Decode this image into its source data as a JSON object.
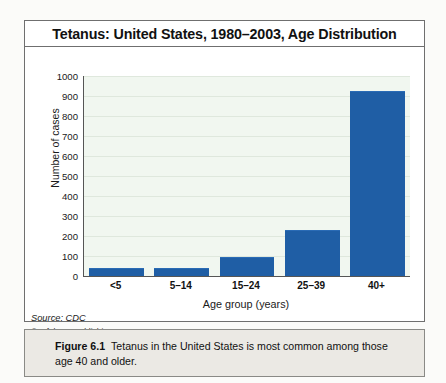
{
  "chart": {
    "title": "Tetanus: United States, 1980–2003, Age Distribution",
    "source": "Source: CDC",
    "copyright": "© Infobase Publishing"
  },
  "caption": {
    "label": "Figure 6.1",
    "text": "Tetanus in the United States is most common among those age 40 and older."
  },
  "colors": {
    "bar": "#1f5ea5",
    "plot_background": "#f1f7f0",
    "gridline": "#dfe8dd",
    "axis": "#555555",
    "caption_background": "#ebe9e4"
  },
  "chart_data": {
    "type": "bar",
    "title": "Tetanus: United States, 1980–2003, Age Distribution",
    "xlabel": "Age group (years)",
    "ylabel": "Number of cases",
    "categories": [
      "<5",
      "5–14",
      "15–24",
      "25–39",
      "40+"
    ],
    "values": [
      35,
      37,
      88,
      225,
      920
    ],
    "ylim": [
      0,
      1000
    ],
    "yticks": [
      0,
      100,
      200,
      300,
      400,
      500,
      600,
      700,
      800,
      900,
      1000
    ],
    "ytick_labels": [
      "0",
      "100",
      "200",
      "300",
      "400",
      "500",
      "600",
      "700",
      "800",
      "900",
      "1000"
    ],
    "grid": true,
    "legend": false,
    "series": [
      {
        "name": "Number of cases",
        "values": [
          35,
          37,
          88,
          225,
          920
        ]
      }
    ]
  }
}
